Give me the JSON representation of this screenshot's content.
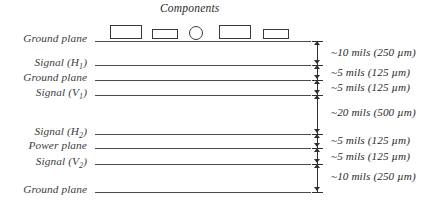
{
  "diagram": {
    "title": "Components",
    "layers": [
      {
        "id": "ground-plane-top",
        "label": "Ground plane",
        "y": 41
      },
      {
        "id": "signal-h1",
        "label": "Signal (H",
        "sub": "1",
        "suffix": ")",
        "y": 65
      },
      {
        "id": "ground-plane-2",
        "label": "Ground plane",
        "y": 80
      },
      {
        "id": "signal-v1",
        "label": "Signal (V",
        "sub": "1",
        "suffix": ")",
        "y": 95
      },
      {
        "id": "signal-h2",
        "label": "Signal (H",
        "sub": "2",
        "suffix": ")",
        "y": 134
      },
      {
        "id": "power-plane",
        "label": "Power plane",
        "y": 148
      },
      {
        "id": "signal-v2",
        "label": "Signal (V",
        "sub": "2",
        "suffix": ")",
        "y": 164
      },
      {
        "id": "ground-plane-bottom",
        "label": "Ground plane",
        "y": 192
      }
    ],
    "components": [
      {
        "id": "component-1",
        "shape": "rect",
        "x": 110,
        "y": 25,
        "w": 32,
        "h": 14
      },
      {
        "id": "component-2",
        "shape": "rect",
        "x": 152,
        "y": 29,
        "w": 26,
        "h": 10
      },
      {
        "id": "component-3",
        "shape": "circle",
        "x": 189,
        "y": 26,
        "w": 14,
        "h": 14
      },
      {
        "id": "component-4",
        "shape": "rect",
        "x": 219,
        "y": 25,
        "w": 32,
        "h": 14
      },
      {
        "id": "component-5",
        "shape": "rect",
        "x": 263,
        "y": 29,
        "w": 26,
        "h": 10
      }
    ],
    "dimensions": [
      {
        "id": "dim-1",
        "text": "~10 mils (250 µm)",
        "top": 41,
        "bottom": 65,
        "label_y": 46
      },
      {
        "id": "dim-2",
        "text": "~5 mils (125 µm)",
        "top": 65,
        "bottom": 80,
        "label_y": 66
      },
      {
        "id": "dim-3",
        "text": "~5 mils (125 µm)",
        "top": 80,
        "bottom": 95,
        "label_y": 81
      },
      {
        "id": "dim-4",
        "text": "~20 mils (500 µm)",
        "top": 95,
        "bottom": 134,
        "label_y": 106
      },
      {
        "id": "dim-5",
        "text": "~5 mils (125 µm)",
        "top": 134,
        "bottom": 148,
        "label_y": 134
      },
      {
        "id": "dim-6",
        "text": "~5 mils (125 µm)",
        "top": 148,
        "bottom": 164,
        "label_y": 150
      },
      {
        "id": "dim-7",
        "text": "~10 mils (250 µm)",
        "top": 164,
        "bottom": 192,
        "label_y": 170
      }
    ],
    "colors": {
      "line": "#4a4a4a",
      "label_text": "#3d3d3d",
      "dim_text": "#2b2b2b",
      "component_stroke": "#3a3a3a",
      "background": "#ffffff"
    }
  }
}
